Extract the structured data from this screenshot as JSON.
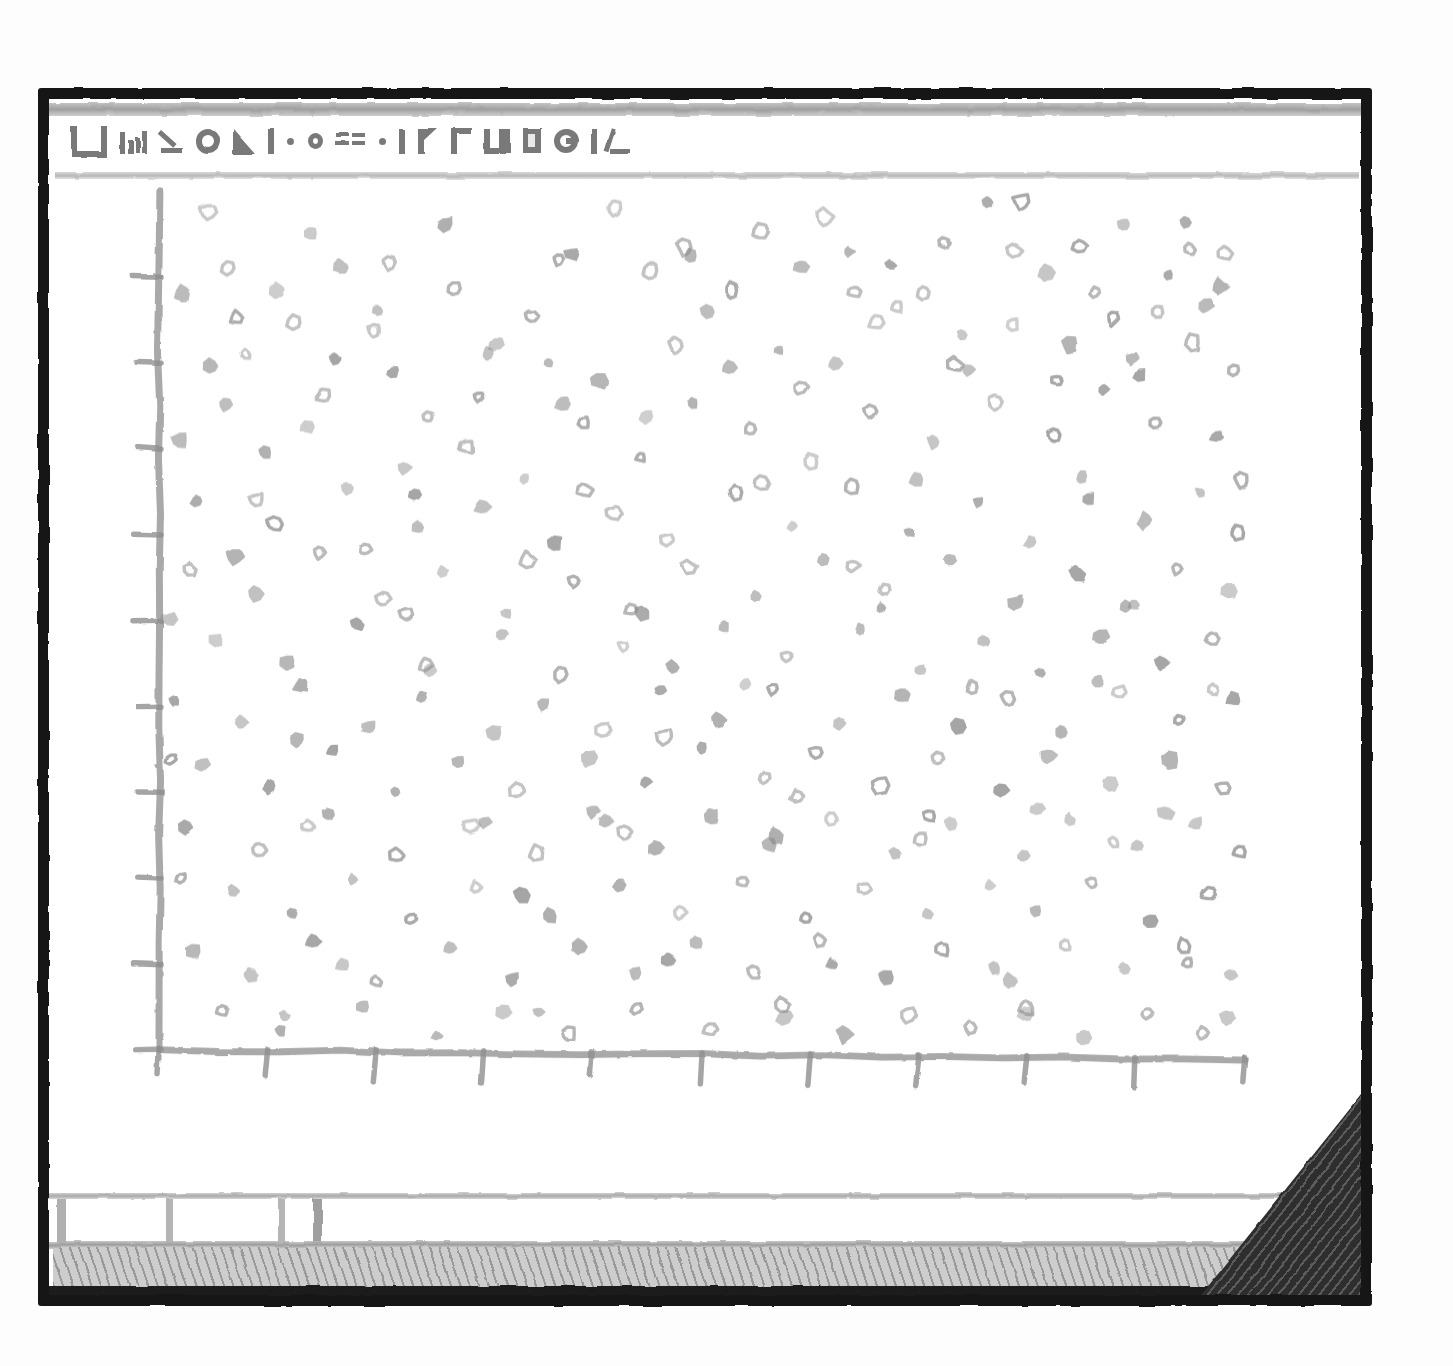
{
  "window": {
    "title_glyphs": [
      "LJ",
      "bars",
      "K",
      "O",
      "triangle",
      "bar",
      "o-small",
      "dashes",
      "dot",
      "bar",
      "flag",
      "gamma",
      "sha",
      "box",
      "cmoon",
      "bar",
      "angle"
    ],
    "frame_color": "#151515",
    "background": "#ffffff"
  },
  "statusbar": {
    "cells": [
      "",
      "",
      "",
      ""
    ],
    "hatch_color": "#cdcdcd",
    "divider_color": "#b5b5b5"
  },
  "resize_grip": {
    "name": "resize-grip",
    "color": "#2e2e2e"
  },
  "axes": {
    "origin_label_y": "0",
    "origin_label_x": "0",
    "axis_color": "#9a9a9a",
    "tick_color": "#8f8f8f",
    "x_tick_count": 11,
    "y_tick_count": 10
  },
  "chart_data": {
    "type": "scatter",
    "title": "",
    "xlabel": "",
    "ylabel": "",
    "xlim": [
      0,
      100
    ],
    "ylim": [
      0,
      100
    ],
    "grid": false,
    "legend": null,
    "marker": {
      "color": "#8c8c8c",
      "shape": "irregular-blob",
      "size_px": [
        9,
        15
      ]
    },
    "xticks": [
      0,
      10,
      20,
      30,
      40,
      50,
      60,
      70,
      80,
      90,
      100
    ],
    "yticks": [
      0,
      10,
      20,
      30,
      40,
      50,
      60,
      70,
      80,
      90
    ],
    "xticklabels": [
      "0",
      "",
      "",
      "",
      "",
      "",
      "",
      "",
      "",
      "",
      ""
    ],
    "yticklabels": [
      "0",
      "",
      "",
      "",
      "",
      "",
      "",
      "",
      "",
      ""
    ],
    "n_points": 300,
    "points": [
      [
        4.6,
        97.5
      ],
      [
        16.8,
        91.2
      ],
      [
        12.5,
        84.6
      ],
      [
        27.2,
        88.6
      ],
      [
        31.1,
        82.0
      ],
      [
        42.0,
        97.9
      ],
      [
        55.4,
        95.2
      ],
      [
        64.1,
        88.3
      ],
      [
        72.3,
        94.0
      ],
      [
        76.4,
        98.6
      ],
      [
        79.5,
        98.7
      ],
      [
        88.9,
        96.0
      ],
      [
        94.6,
        96.3
      ],
      [
        98.2,
        92.7
      ],
      [
        2.2,
        88.0
      ],
      [
        8.0,
        80.9
      ],
      [
        21.5,
        78.8
      ],
      [
        34.3,
        85.4
      ],
      [
        37.2,
        75.3
      ],
      [
        45.3,
        90.7
      ],
      [
        50.6,
        85.9
      ],
      [
        59.2,
        91.2
      ],
      [
        66.1,
        84.6
      ],
      [
        70.5,
        88.2
      ],
      [
        81.8,
        90.5
      ],
      [
        86.3,
        88.2
      ],
      [
        92.0,
        85.9
      ],
      [
        96.4,
        86.6
      ],
      [
        6.1,
        75.1
      ],
      [
        13.6,
        72.4
      ],
      [
        19.9,
        83.8
      ],
      [
        24.8,
        73.6
      ],
      [
        30.3,
        81.1
      ],
      [
        35.9,
        80.0
      ],
      [
        40.5,
        77.8
      ],
      [
        47.7,
        82.0
      ],
      [
        52.8,
        88.5
      ],
      [
        57.1,
        81.4
      ],
      [
        62.3,
        79.9
      ],
      [
        67.4,
        91.3
      ],
      [
        74.0,
        83.2
      ],
      [
        78.7,
        84.5
      ],
      [
        83.9,
        82.1
      ],
      [
        89.6,
        80.5
      ],
      [
        95.2,
        82.3
      ],
      [
        99.1,
        79.1
      ],
      [
        1.9,
        70.9
      ],
      [
        9.8,
        69.5
      ],
      [
        15.2,
        76.1
      ],
      [
        22.6,
        67.8
      ],
      [
        28.4,
        70.3
      ],
      [
        33.7,
        66.5
      ],
      [
        39.1,
        73.1
      ],
      [
        44.4,
        69.0
      ],
      [
        49.2,
        75.2
      ],
      [
        54.5,
        72.2
      ],
      [
        60.1,
        68.4
      ],
      [
        65.6,
        74.3
      ],
      [
        71.4,
        70.8
      ],
      [
        77.2,
        75.5
      ],
      [
        82.5,
        71.6
      ],
      [
        87.1,
        76.9
      ],
      [
        91.8,
        73.0
      ],
      [
        97.5,
        71.3
      ],
      [
        3.5,
        63.9
      ],
      [
        10.7,
        61.2
      ],
      [
        17.4,
        65.4
      ],
      [
        23.9,
        60.8
      ],
      [
        29.8,
        63.2
      ],
      [
        36.5,
        58.9
      ],
      [
        41.8,
        62.5
      ],
      [
        46.9,
        59.4
      ],
      [
        53.2,
        64.8
      ],
      [
        58.4,
        61.0
      ],
      [
        63.9,
        65.6
      ],
      [
        69.2,
        60.2
      ],
      [
        75.5,
        63.8
      ],
      [
        80.3,
        59.1
      ],
      [
        85.7,
        64.2
      ],
      [
        90.9,
        61.7
      ],
      [
        96.0,
        64.9
      ],
      [
        99.4,
        60.3
      ],
      [
        2.8,
        56.0
      ],
      [
        8.9,
        53.1
      ],
      [
        14.8,
        57.9
      ],
      [
        20.6,
        52.4
      ],
      [
        26.1,
        55.7
      ],
      [
        32.0,
        50.8
      ],
      [
        38.3,
        54.6
      ],
      [
        43.5,
        51.2
      ],
      [
        48.8,
        56.3
      ],
      [
        55.0,
        52.7
      ],
      [
        61.2,
        57.1
      ],
      [
        66.8,
        53.5
      ],
      [
        72.9,
        56.8
      ],
      [
        79.0,
        52.0
      ],
      [
        84.6,
        55.4
      ],
      [
        89.2,
        51.6
      ],
      [
        93.8,
        56.0
      ],
      [
        98.6,
        53.4
      ],
      [
        5.3,
        47.8
      ],
      [
        11.9,
        45.2
      ],
      [
        18.2,
        49.6
      ],
      [
        25.0,
        44.1
      ],
      [
        31.6,
        48.3
      ],
      [
        37.0,
        43.7
      ],
      [
        42.8,
        47.0
      ],
      [
        47.4,
        44.5
      ],
      [
        52.1,
        49.2
      ],
      [
        57.9,
        45.8
      ],
      [
        64.6,
        48.9
      ],
      [
        70.1,
        44.2
      ],
      [
        76.0,
        47.6
      ],
      [
        81.2,
        43.9
      ],
      [
        86.8,
        48.1
      ],
      [
        92.4,
        45.0
      ],
      [
        97.0,
        47.9
      ],
      [
        1.4,
        40.6
      ],
      [
        7.6,
        38.1
      ],
      [
        13.1,
        42.4
      ],
      [
        19.4,
        37.5
      ],
      [
        24.2,
        41.0
      ],
      [
        30.9,
        36.8
      ],
      [
        35.4,
        40.2
      ],
      [
        40.9,
        37.2
      ],
      [
        46.2,
        41.8
      ],
      [
        51.5,
        38.4
      ],
      [
        56.6,
        42.0
      ],
      [
        62.8,
        38.0
      ],
      [
        68.5,
        41.4
      ],
      [
        73.6,
        37.6
      ],
      [
        78.2,
        40.9
      ],
      [
        83.2,
        37.0
      ],
      [
        88.4,
        41.6
      ],
      [
        94.0,
        38.3
      ],
      [
        99.0,
        40.8
      ],
      [
        4.0,
        33.2
      ],
      [
        10.2,
        30.6
      ],
      [
        16.0,
        34.8
      ],
      [
        21.8,
        29.9
      ],
      [
        27.6,
        33.5
      ],
      [
        33.0,
        30.1
      ],
      [
        39.6,
        34.0
      ],
      [
        44.9,
        31.2
      ],
      [
        50.0,
        35.1
      ],
      [
        55.8,
        31.7
      ],
      [
        60.6,
        34.6
      ],
      [
        66.4,
        30.8
      ],
      [
        71.8,
        33.9
      ],
      [
        77.6,
        30.2
      ],
      [
        82.0,
        34.3
      ],
      [
        87.6,
        31.0
      ],
      [
        93.2,
        33.7
      ],
      [
        98.0,
        30.5
      ],
      [
        2.5,
        25.9
      ],
      [
        9.2,
        23.2
      ],
      [
        15.6,
        27.4
      ],
      [
        22.0,
        22.6
      ],
      [
        28.8,
        26.1
      ],
      [
        34.8,
        22.9
      ],
      [
        41.2,
        26.6
      ],
      [
        45.8,
        23.4
      ],
      [
        51.0,
        27.0
      ],
      [
        56.2,
        23.8
      ],
      [
        61.8,
        26.9
      ],
      [
        67.8,
        23.0
      ],
      [
        73.0,
        26.3
      ],
      [
        79.6,
        22.7
      ],
      [
        84.0,
        26.8
      ],
      [
        90.2,
        23.6
      ],
      [
        95.6,
        26.4
      ],
      [
        99.6,
        23.1
      ],
      [
        6.8,
        18.5
      ],
      [
        12.2,
        15.9
      ],
      [
        17.8,
        19.8
      ],
      [
        23.2,
        15.2
      ],
      [
        29.2,
        18.9
      ],
      [
        36.0,
        15.6
      ],
      [
        42.4,
        19.3
      ],
      [
        48.0,
        16.0
      ],
      [
        53.8,
        19.6
      ],
      [
        59.6,
        15.4
      ],
      [
        65.0,
        18.7
      ],
      [
        70.8,
        15.8
      ],
      [
        76.6,
        19.1
      ],
      [
        80.8,
        16.2
      ],
      [
        86.0,
        19.4
      ],
      [
        91.4,
        15.0
      ],
      [
        96.8,
        18.2
      ],
      [
        3.2,
        11.4
      ],
      [
        8.4,
        8.7
      ],
      [
        14.2,
        12.6
      ],
      [
        20.0,
        7.9
      ],
      [
        26.8,
        11.8
      ],
      [
        32.6,
        8.2
      ],
      [
        38.8,
        12.0
      ],
      [
        43.8,
        8.9
      ],
      [
        49.6,
        12.4
      ],
      [
        54.8,
        9.1
      ],
      [
        60.9,
        12.8
      ],
      [
        67.0,
        8.4
      ],
      [
        72.2,
        11.6
      ],
      [
        78.4,
        8.0
      ],
      [
        83.6,
        12.2
      ],
      [
        89.0,
        9.4
      ],
      [
        94.4,
        12.1
      ],
      [
        98.8,
        8.6
      ],
      [
        5.8,
        4.6
      ],
      [
        11.2,
        2.1
      ],
      [
        18.8,
        5.0
      ],
      [
        25.6,
        1.6
      ],
      [
        31.8,
        4.4
      ],
      [
        37.8,
        1.9
      ],
      [
        44.0,
        4.8
      ],
      [
        50.8,
        2.4
      ],
      [
        57.4,
        5.2
      ],
      [
        63.2,
        1.8
      ],
      [
        69.0,
        4.1
      ],
      [
        74.8,
        2.6
      ],
      [
        80.0,
        4.9
      ],
      [
        85.2,
        1.4
      ],
      [
        91.0,
        4.3
      ],
      [
        96.2,
        2.0
      ],
      [
        7.2,
        85.2
      ],
      [
        14.0,
        95.0
      ],
      [
        26.4,
        96.1
      ],
      [
        48.4,
        93.4
      ],
      [
        61.4,
        97.0
      ],
      [
        74.6,
        79.2
      ],
      [
        84.8,
        93.6
      ],
      [
        97.8,
        88.9
      ],
      [
        10.9,
        88.4
      ],
      [
        20.2,
        86.0
      ],
      [
        38.0,
        92.6
      ],
      [
        52.6,
        79.4
      ],
      [
        68.0,
        86.5
      ],
      [
        87.9,
        85.1
      ],
      [
        93.0,
        90.2
      ],
      [
        4.8,
        79.6
      ],
      [
        16.2,
        80.4
      ],
      [
        29.5,
        76.0
      ],
      [
        45.0,
        73.8
      ],
      [
        59.0,
        77.2
      ],
      [
        73.4,
        79.8
      ],
      [
        82.8,
        78.0
      ],
      [
        90.4,
        78.6
      ],
      [
        1.2,
        33.8
      ],
      [
        7.0,
        57.4
      ],
      [
        12.8,
        36.0
      ],
      [
        19.0,
        58.2
      ],
      [
        24.6,
        44.8
      ],
      [
        34.0,
        57.0
      ],
      [
        40.0,
        27.8
      ],
      [
        46.6,
        36.4
      ],
      [
        54.0,
        42.6
      ],
      [
        58.8,
        29.4
      ],
      [
        64.0,
        56.4
      ],
      [
        71.0,
        27.2
      ],
      [
        75.0,
        42.2
      ],
      [
        81.0,
        28.0
      ],
      [
        86.4,
        42.9
      ],
      [
        92.8,
        27.6
      ],
      [
        97.2,
        42.0
      ],
      [
        2.0,
        20.0
      ],
      [
        9.0,
        64.0
      ],
      [
        17.0,
        9.8
      ],
      [
        23.6,
        64.6
      ],
      [
        33.4,
        18.0
      ],
      [
        39.2,
        65.2
      ],
      [
        47.0,
        10.4
      ],
      [
        55.6,
        66.0
      ],
      [
        62.0,
        10.0
      ],
      [
        69.8,
        66.4
      ],
      [
        77.0,
        9.6
      ],
      [
        85.0,
        66.8
      ],
      [
        94.8,
        10.2
      ],
      [
        99.8,
        66.2
      ],
      [
        6.4,
        91.0
      ],
      [
        13.8,
        26.0
      ],
      [
        21.2,
        91.6
      ],
      [
        30.0,
        26.5
      ],
      [
        36.8,
        92.0
      ],
      [
        43.0,
        25.4
      ],
      [
        49.0,
        92.4
      ],
      [
        56.8,
        25.0
      ],
      [
        63.6,
        92.8
      ],
      [
        70.2,
        24.6
      ],
      [
        78.8,
        93.0
      ],
      [
        88.0,
        24.2
      ],
      [
        95.0,
        93.2
      ],
      [
        0.9,
        50.2
      ],
      [
        11.6,
        4.0
      ],
      [
        22.8,
        50.6
      ],
      [
        35.0,
        4.4
      ],
      [
        44.6,
        51.0
      ],
      [
        57.6,
        3.8
      ],
      [
        66.6,
        51.4
      ],
      [
        79.8,
        4.2
      ],
      [
        89.8,
        51.8
      ],
      [
        98.4,
        3.6
      ]
    ]
  }
}
